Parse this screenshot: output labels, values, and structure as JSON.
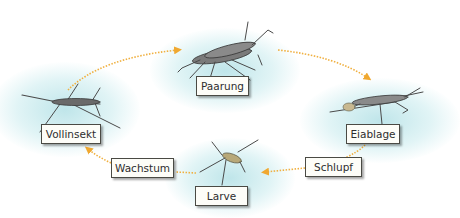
{
  "diagram": {
    "type": "life-cycle",
    "colors": {
      "arrow": "#f0a830",
      "water_glow": "#b4e1e6",
      "label_border": "#4a4a44",
      "label_bg": "#fdfdf8",
      "insect": "#5a5a5a"
    },
    "stages": [
      {
        "id": "vollinsekt",
        "label": "Vollinsekt"
      },
      {
        "id": "paarung",
        "label": "Paarung"
      },
      {
        "id": "eiablage",
        "label": "Eiablage"
      },
      {
        "id": "larve",
        "label": "Larve"
      }
    ],
    "transitions": [
      {
        "id": "schlupf",
        "label": "Schlupf",
        "from": "eiablage",
        "to": "larve"
      },
      {
        "id": "wachstum",
        "label": "Wachstum",
        "from": "larve",
        "to": "vollinsekt"
      }
    ],
    "arrows": [
      {
        "from": "vollinsekt",
        "to": "paarung"
      },
      {
        "from": "paarung",
        "to": "eiablage"
      },
      {
        "from": "eiablage",
        "to": "larve",
        "via": "schlupf"
      },
      {
        "from": "larve",
        "to": "vollinsekt",
        "via": "wachstum"
      }
    ]
  }
}
